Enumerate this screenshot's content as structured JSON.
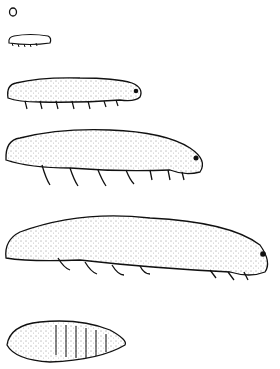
{
  "figure": {
    "stages": [
      {
        "name": "egg"
      },
      {
        "name": "larva-instar-1"
      },
      {
        "name": "larva-instar-2"
      },
      {
        "name": "larva-instar-3"
      },
      {
        "name": "larva-instar-4"
      },
      {
        "name": "pupa"
      }
    ],
    "colors": {
      "ink": "#111111",
      "paper": "#ffffff"
    }
  }
}
